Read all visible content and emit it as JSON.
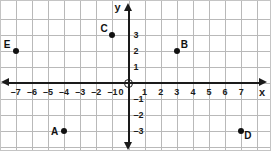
{
  "figure": {
    "kind": "coordinate-plane",
    "origin_label": "0"
  },
  "chart_data": {
    "type": "scatter",
    "title": "",
    "xlabel": "x",
    "ylabel": "y",
    "xlim": [
      -7.8,
      7.8
    ],
    "ylim": [
      -3.8,
      3.8
    ],
    "grid": true,
    "legend": "none",
    "x_ticks": [
      "–7",
      "–6",
      "–5",
      "–4",
      "–3",
      "–2",
      "–1",
      "1",
      "2",
      "3",
      "4",
      "5",
      "6",
      "7"
    ],
    "x_tick_values": [
      -7,
      -6,
      -5,
      -4,
      -3,
      -2,
      -1,
      1,
      2,
      3,
      4,
      5,
      6,
      7
    ],
    "y_ticks": [
      "3",
      "2",
      "1",
      "–1",
      "–2",
      "–3"
    ],
    "y_tick_values": [
      3,
      2,
      1,
      -1,
      -2,
      -3
    ],
    "points": [
      {
        "label": "A",
        "x": -4,
        "y": -3,
        "label_position": "left"
      },
      {
        "label": "B",
        "x": 3,
        "y": 2,
        "label_position": "upper-right"
      },
      {
        "label": "C",
        "x": -1,
        "y": 3,
        "label_position": "upper-left"
      },
      {
        "label": "D",
        "x": 7,
        "y": -3,
        "label_position": "lower-right"
      },
      {
        "label": "E",
        "x": -7,
        "y": 2,
        "label_position": "upper-left"
      }
    ]
  },
  "colors": {
    "grid": "#b9b9b9",
    "axis": "#1a1a1a",
    "point": "#111111",
    "background": "#ffffff"
  }
}
